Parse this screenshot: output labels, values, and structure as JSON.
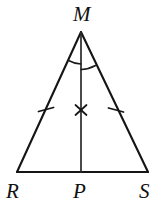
{
  "figure": {
    "type": "geometry-diagram",
    "shape": "isosceles-triangle",
    "stroke_color": "#151515",
    "background_color": "#ffffff",
    "labels": {
      "apex": "M",
      "base_left": "R",
      "base_midpoint": "P",
      "base_right": "S"
    },
    "vertices": {
      "M": {
        "x": 81,
        "y": 32
      },
      "R": {
        "x": 17,
        "y": 172
      },
      "P": {
        "x": 81,
        "y": 172
      },
      "S": {
        "x": 148,
        "y": 172
      }
    },
    "label_positions": {
      "M": {
        "x": 73,
        "y": 4
      },
      "R": {
        "x": 6,
        "y": 181
      },
      "P": {
        "x": 73,
        "y": 181
      },
      "S": {
        "x": 139,
        "y": 181
      }
    },
    "segments": [
      {
        "name": "side-MR",
        "from": "M",
        "to": "R"
      },
      {
        "name": "side-MS",
        "from": "M",
        "to": "S"
      },
      {
        "name": "base-RS",
        "from": "R",
        "to": "S"
      },
      {
        "name": "median-MP",
        "from": "M",
        "to": "P"
      }
    ],
    "marks": {
      "congruent_side_ticks": [
        {
          "name": "tick-MR",
          "x": 46,
          "y": 110,
          "count": 1
        },
        {
          "name": "tick-MS",
          "x": 116,
          "y": 110,
          "count": 1
        }
      ],
      "cross_mark": {
        "name": "cross-MP",
        "x": 81,
        "y": 110
      },
      "angle_arcs": [
        {
          "name": "angle-arc-RMP",
          "side": "left"
        },
        {
          "name": "angle-arc-PMS",
          "side": "right"
        }
      ]
    }
  }
}
